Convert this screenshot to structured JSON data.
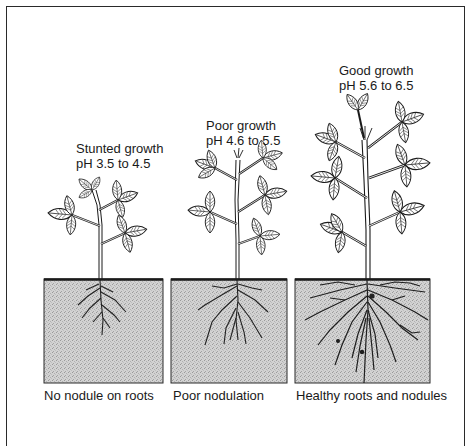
{
  "figure": {
    "plants": [
      {
        "growth_label": "Stunted growth",
        "ph_label": "pH 3.5 to 4.5",
        "caption": "No nodule on roots"
      },
      {
        "growth_label": "Poor growth",
        "ph_label": "pH 4.6 to 5.5",
        "caption": "Poor nodulation"
      },
      {
        "growth_label": "Good growth",
        "ph_label": "pH 5.6 to 6.5",
        "caption": "Healthy roots and nodules"
      }
    ],
    "colors": {
      "ink": "#1a1a1a",
      "soil": "#cfcfcf",
      "soil_dark": "#a8a8a8",
      "background": "#ffffff"
    }
  }
}
